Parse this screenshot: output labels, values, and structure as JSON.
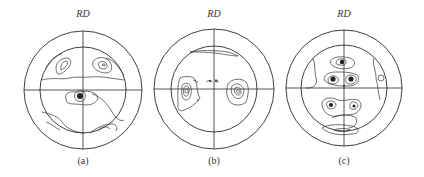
{
  "figure": {
    "axis_label": "RD",
    "panels": [
      {
        "id": "a",
        "label": "(a)",
        "cx": 83,
        "cy": 90,
        "outer_r": 59,
        "inner_r": 43
      },
      {
        "id": "b",
        "label": "(b)",
        "cx": 214,
        "cy": 89,
        "outer_r": 60,
        "inner_r": 43
      },
      {
        "id": "c",
        "label": "(c)",
        "cx": 344,
        "cy": 88,
        "outer_r": 58,
        "inner_r": 43
      }
    ]
  },
  "labels": {
    "a_rd": "RD",
    "b_rd": "RD",
    "c_rd": "RD",
    "a": "(a)",
    "b": "(b)",
    "c": "(c)"
  },
  "colors": {
    "background": "#ffffff",
    "line": "#2a2a2a"
  }
}
